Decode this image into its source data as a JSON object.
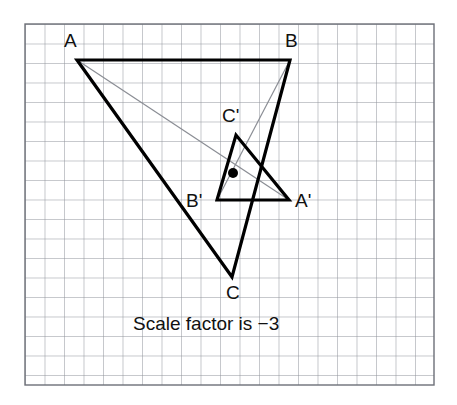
{
  "figure": {
    "caption": "Scale factor is −3",
    "scale_factor": "−3",
    "colors": {
      "grid_line": "#8e9199",
      "grid_border": "#6d7078",
      "shape_stroke": "#000000",
      "ray_stroke": "#8a8d94",
      "center_dot": "#000000",
      "background": "#ffffff",
      "label_text": "#111111"
    },
    "grid": {
      "x": 25,
      "y": 24,
      "width": 409,
      "height": 361,
      "cell": 19.5,
      "cols": 21,
      "rows": 18.5
    },
    "center_of_enlargement": {
      "x": 233,
      "y": 173,
      "radius": 5
    },
    "object_triangle": {
      "name": "triangle-ABC",
      "stroke_width": 3.2,
      "vertices": [
        {
          "label": "A",
          "x": 77,
          "y": 60,
          "label_x": 64,
          "label_y": 47
        },
        {
          "label": "B",
          "x": 290,
          "y": 60,
          "label_x": 285,
          "label_y": 47
        },
        {
          "label": "C",
          "x": 232,
          "y": 277,
          "label_x": 226,
          "label_y": 299
        }
      ]
    },
    "image_triangle": {
      "name": "triangle-A-prime-B-prime-C-prime",
      "stroke_width": 3.2,
      "vertices": [
        {
          "label": "A'",
          "x": 289,
          "y": 200,
          "label_x": 295,
          "label_y": 207
        },
        {
          "label": "B'",
          "x": 217,
          "y": 200,
          "label_x": 186,
          "label_y": 207
        },
        {
          "label": "C'",
          "x": 236,
          "y": 135,
          "label_x": 222,
          "label_y": 122
        }
      ]
    },
    "rays": [
      {
        "name": "ray-A-to-A-prime",
        "x1": 77,
        "y1": 60,
        "x2": 289,
        "y2": 200
      },
      {
        "name": "ray-B-to-B-prime",
        "x1": 290,
        "y1": 60,
        "x2": 217,
        "y2": 200
      }
    ],
    "caption_position": {
      "x": 133,
      "y": 330
    }
  }
}
